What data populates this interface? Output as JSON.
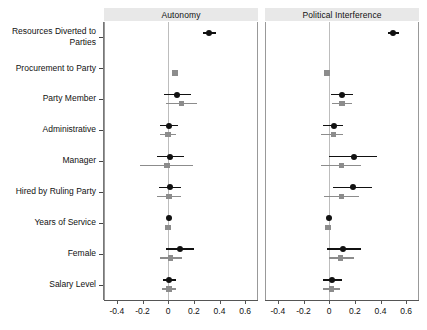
{
  "chart_data": {
    "type": "scatter",
    "title": "",
    "subtitle": "",
    "xlabel": "",
    "ylabel": "",
    "xlim": [
      -0.5,
      0.7
    ],
    "xticks": [
      -0.4,
      -0.2,
      0,
      0.2,
      0.4,
      0.6
    ],
    "xticklabels": [
      "-0.4",
      "-0.2",
      "0",
      "0.2",
      "0.4",
      "0.6"
    ],
    "grid": false,
    "legend_position": "none",
    "zero_reference_line": 0,
    "annotations": [
      "Coefficient plot with 95% confidence intervals, two models per outcome"
    ],
    "panels": [
      {
        "key": "autonomy",
        "label": "Autonomy"
      },
      {
        "key": "political_interference",
        "label": "Political Interference"
      }
    ],
    "categories": [
      "Resources Diverted to\nParties",
      "Procurement to Party",
      "Party Member",
      "Administrative",
      "Manager",
      "Hired by Ruling Party",
      "Years of Service",
      "Female",
      "Salary Level"
    ],
    "series": [
      {
        "name": "Model 1",
        "panel": "autonomy",
        "marker": "circle",
        "color": "#111111",
        "values": [
          0.32,
          null,
          0.07,
          0.01,
          0.015,
          0.015,
          0.005,
          0.09,
          0.01
        ],
        "ci_low": [
          0.27,
          null,
          -0.035,
          -0.06,
          -0.09,
          -0.07,
          -0.005,
          -0.015,
          -0.04
        ],
        "ci_high": [
          0.375,
          null,
          0.175,
          0.075,
          0.125,
          0.1,
          0.015,
          0.2,
          0.06
        ]
      },
      {
        "name": "Model 2",
        "panel": "autonomy",
        "marker": "square",
        "color": "#8c8c8c",
        "values": [
          null,
          0.055,
          0.105,
          0.0,
          -0.01,
          0.005,
          0.0,
          0.02,
          0.005
        ],
        "ci_low": [
          null,
          0.055,
          -0.015,
          -0.06,
          -0.22,
          -0.085,
          -0.005,
          -0.065,
          -0.045
        ],
        "ci_high": [
          null,
          0.055,
          0.225,
          0.06,
          0.195,
          0.1,
          0.01,
          0.11,
          0.06
        ]
      },
      {
        "name": "Model 1",
        "panel": "political_interference",
        "marker": "circle",
        "color": "#111111",
        "values": [
          0.5,
          null,
          0.1,
          0.035,
          0.19,
          0.185,
          -0.005,
          0.105,
          0.025
        ],
        "ci_low": [
          0.455,
          null,
          0.015,
          -0.045,
          0.0,
          0.03,
          -0.01,
          -0.015,
          -0.045
        ],
        "ci_high": [
          0.545,
          null,
          0.185,
          0.11,
          0.375,
          0.335,
          0.0,
          0.25,
          0.1
        ]
      },
      {
        "name": "Model 2",
        "panel": "political_interference",
        "marker": "square",
        "color": "#8c8c8c",
        "values": [
          null,
          -0.015,
          0.1,
          0.035,
          0.095,
          0.095,
          -0.01,
          0.09,
          0.02
        ],
        "ci_low": [
          null,
          -0.015,
          0.025,
          -0.06,
          -0.065,
          -0.04,
          -0.012,
          -0.005,
          -0.045
        ],
        "ci_high": [
          null,
          -0.015,
          0.175,
          0.105,
          0.25,
          0.235,
          -0.008,
          0.195,
          0.085
        ]
      }
    ]
  },
  "colors": {
    "series_1": "#111111",
    "series_2": "#8c8c8c",
    "panel_strip_bg": "#e8e8e8",
    "zero_line": "#bdbdbd",
    "axis": "#555555",
    "background": "#ffffff"
  }
}
